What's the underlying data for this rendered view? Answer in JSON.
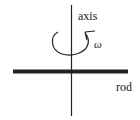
{
  "diagram": {
    "labels": {
      "axis": "axis",
      "omega": "ω",
      "rod": "rod"
    },
    "colors": {
      "line": "#222222",
      "background": "#ffffff"
    }
  }
}
